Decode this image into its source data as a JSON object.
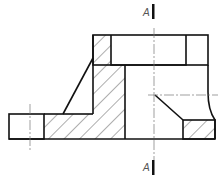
{
  "drawing": {
    "type": "section-view",
    "section_labels": {
      "top": "A",
      "bottom": "A"
    },
    "colors": {
      "outline": "#111111",
      "hatch": "#333333",
      "centerline": "#777777",
      "label": "#555555",
      "background": "#ffffff"
    }
  }
}
